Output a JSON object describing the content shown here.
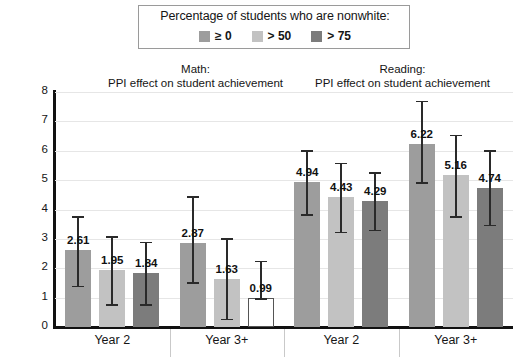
{
  "legend": {
    "title": "Percentage of students who are nonwhite:",
    "items": [
      {
        "label": "≥ 0",
        "color": "#9d9d9d"
      },
      {
        "label": "> 50",
        "color": "#c2c2c2"
      },
      {
        "label": "> 75",
        "color": "#7c7c7c"
      }
    ]
  },
  "panels": [
    {
      "line1": "Math:",
      "line2": "PPI effect on student achievement"
    },
    {
      "line1": "Reading:",
      "line2": "PPI effect on student achievement"
    }
  ],
  "axis": {
    "ylabel": "Percentile points",
    "yticks": [
      "0",
      "1",
      "2",
      "3",
      "4",
      "5",
      "6",
      "7",
      "8"
    ],
    "xlabels": [
      "Year 2",
      "Year 3+",
      "Year 2",
      "Year 3+"
    ]
  },
  "chart_data": {
    "type": "bar",
    "title": "PPI effect on student achievement",
    "xlabel": "",
    "ylabel": "Percentile points",
    "ylim": [
      0,
      8
    ],
    "grid": true,
    "legend_position": "top",
    "legend_title": "Percentage of students who are nonwhite:",
    "categories": [
      "Math Year 2",
      "Math Year 3+",
      "Reading Year 2",
      "Reading Year 3+"
    ],
    "series": [
      {
        "name": "≥ 0",
        "color": "#9d9d9d",
        "values": [
          2.61,
          2.87,
          4.94,
          6.22
        ],
        "err_low": [
          1.4,
          1.52,
          3.85,
          4.92
        ],
        "err_high": [
          3.77,
          4.45,
          6.01,
          7.7
        ]
      },
      {
        "name": "> 50",
        "color": "#c2c2c2",
        "values": [
          1.95,
          1.63,
          4.43,
          5.16
        ],
        "err_low": [
          0.77,
          0.28,
          3.25,
          3.78
        ],
        "err_high": [
          3.1,
          3.02,
          5.6,
          6.54
        ]
      },
      {
        "name": "> 75",
        "color": "#7c7c7c",
        "values": [
          1.84,
          0.99,
          4.29,
          4.74
        ],
        "err_low": [
          0.77,
          0.99,
          3.31,
          3.48
        ],
        "err_high": [
          2.9,
          2.26,
          5.26,
          6.02
        ],
        "hollow_points": [
          false,
          true,
          false,
          false
        ]
      }
    ],
    "bar_labels": [
      [
        "2.61",
        "1.95",
        "1.84"
      ],
      [
        "2.87",
        "1.63",
        "0.99"
      ],
      [
        "4.94",
        "4.43",
        "4.29"
      ],
      [
        "6.22",
        "5.16",
        "4.74"
      ]
    ]
  }
}
